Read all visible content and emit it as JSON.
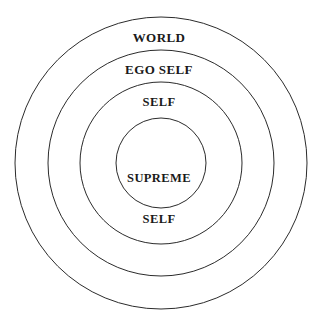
{
  "figure": {
    "type": "concentric-circle-diagram",
    "background_color": "#ffffff",
    "stroke_color": "#2b2b2b",
    "text_color": "#1a1a1a",
    "width": 318,
    "height": 332
  },
  "chart_data": {
    "type": "diagram",
    "subtype": "concentric-circles",
    "title": "",
    "center": {
      "x": 161,
      "y": 163
    },
    "grid": false,
    "legend": "none",
    "rings": [
      {
        "label": "WORLD",
        "level": 1,
        "radius": 146,
        "label_position": "top-of-band",
        "stroke_color": "#2b2b2b"
      },
      {
        "label": "EGO SELF",
        "level": 2,
        "radius": 113,
        "label_position": "top-of-band",
        "stroke_color": "#2b2b2b"
      },
      {
        "label": "SELF",
        "level": 3,
        "radius": 81,
        "label_position": "top-of-band",
        "stroke_color": "#2b2b2b"
      },
      {
        "label": "SUPREME\nSELF",
        "level": 4,
        "radius": 45,
        "label_position": "center",
        "stroke_color": "#2b2b2b"
      }
    ]
  },
  "labels": {
    "world": "WORLD",
    "ego_self": "EGO SELF",
    "self": "SELF",
    "supreme_self_line1": "SUPREME",
    "supreme_self_line2": "SELF"
  }
}
